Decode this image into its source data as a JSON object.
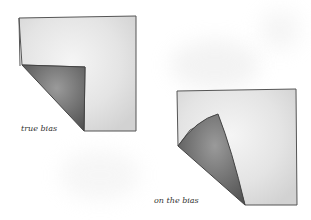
{
  "figure": {
    "labels": {
      "true_bias": "true bias",
      "on_the_bias": "on the bias"
    },
    "colors": {
      "fabric": "#eaeaea",
      "fold": "#6f6f6f",
      "outline": "#444444"
    }
  }
}
